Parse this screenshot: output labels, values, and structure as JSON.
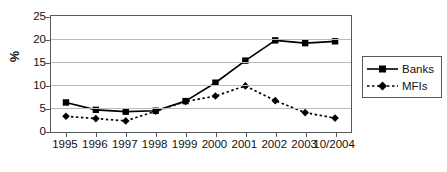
{
  "chart_data": {
    "type": "line",
    "title": "",
    "xlabel": "",
    "ylabel": "%",
    "categories": [
      "1995",
      "1996",
      "1997",
      "1998",
      "1999",
      "2000",
      "2001",
      "2002",
      "2003",
      "10/2004"
    ],
    "ylim": [
      0,
      25
    ],
    "yticks": [
      0,
      5,
      10,
      15,
      20,
      25
    ],
    "ytick_labels": [
      "0",
      "5",
      "10",
      "15",
      "20",
      "25"
    ],
    "grid": "horizontal",
    "legend_position": "right",
    "series": [
      {
        "name": "Banks",
        "marker": "square",
        "line_style": "solid",
        "color": "#000000",
        "values": [
          6.2,
          4.6,
          4.2,
          4.4,
          6.5,
          10.5,
          15.3,
          19.7,
          19.1,
          19.5
        ]
      },
      {
        "name": "MFIs",
        "marker": "diamond",
        "line_style": "dotted",
        "color": "#000000",
        "values": [
          3.2,
          2.7,
          2.2,
          4.3,
          6.4,
          7.6,
          9.8,
          6.6,
          4.0,
          2.8
        ]
      }
    ]
  },
  "legend": {
    "items": [
      {
        "label": "Banks"
      },
      {
        "label": "MFIs"
      }
    ]
  },
  "axes": {
    "y_axis_title": "%"
  }
}
